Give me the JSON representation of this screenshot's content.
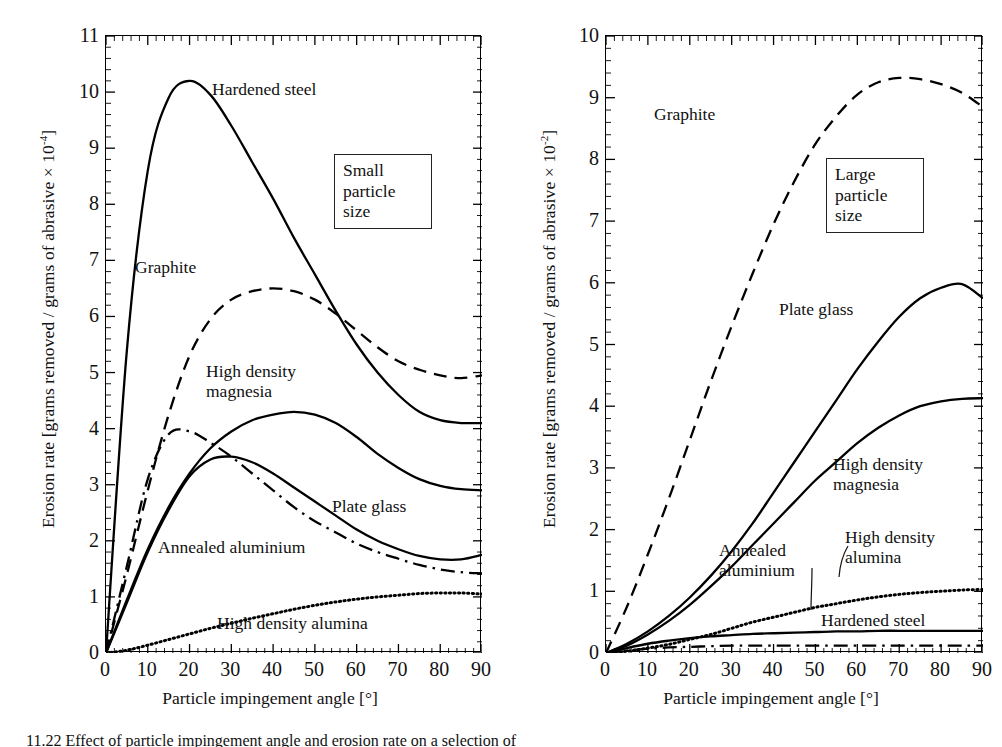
{
  "figure": {
    "caption": "11.22  Effect of particle impingement angle and erosion rate on a selection of"
  },
  "panels": [
    {
      "id": "small-particle",
      "note_box": "Small\nparticle\nsize",
      "xlabel": "Particle impingement angle [°]",
      "ylabel_pre": "Erosion rate [grams removed / grams of abrasive × 10",
      "ylabel_sup": "-4",
      "ylabel_post": "]",
      "yticks": [
        "0",
        "1",
        "2",
        "3",
        "4",
        "5",
        "6",
        "7",
        "8",
        "9",
        "10",
        "11"
      ],
      "xticks": [
        "0",
        "10",
        "20",
        "30",
        "40",
        "50",
        "60",
        "70",
        "80",
        "90"
      ],
      "curve_labels": [
        "Hardened steel",
        "Graphite",
        "High density\nmagnesia",
        "Plate glass",
        "Annealed aluminium",
        "High density alumina"
      ]
    },
    {
      "id": "large-particle",
      "note_box": "Large\nparticle\nsize",
      "xlabel": "Particle impingement angle [°]",
      "ylabel_pre": "Erosion rate [grams removed / grams of abrasive × 10",
      "ylabel_sup": "-2",
      "ylabel_post": "]",
      "yticks": [
        "0",
        "1",
        "2",
        "3",
        "4",
        "5",
        "6",
        "7",
        "8",
        "9",
        "10"
      ],
      "xticks": [
        "0",
        "10",
        "20",
        "30",
        "40",
        "50",
        "60",
        "70",
        "80",
        "90"
      ],
      "curve_labels": [
        "Graphite",
        "Plate glass",
        "High density\nmagnesia",
        "High density\nalumina",
        "Annealed\naluminium",
        "Hardened steel"
      ]
    }
  ],
  "chart_data": [
    {
      "type": "line",
      "title": "Small particle size",
      "xlabel": "Particle impingement angle [°]",
      "ylabel": "Erosion rate [grams removed / grams of abrasive × 10^-4]",
      "xlim": [
        0,
        90
      ],
      "ylim": [
        0,
        11
      ],
      "xticks": [
        0,
        10,
        20,
        30,
        40,
        50,
        60,
        70,
        80,
        90
      ],
      "yticks": [
        0,
        1,
        2,
        3,
        4,
        5,
        6,
        7,
        8,
        9,
        10,
        11
      ],
      "grid": false,
      "legend": "inline-labels",
      "x": [
        0,
        5,
        10,
        15,
        20,
        25,
        30,
        35,
        40,
        45,
        50,
        55,
        60,
        65,
        70,
        75,
        80,
        85,
        90
      ],
      "series": [
        {
          "name": "Hardened steel",
          "style": "solid",
          "values": [
            0,
            5.4,
            8.6,
            9.9,
            10.2,
            9.95,
            9.4,
            8.75,
            8.1,
            7.4,
            6.75,
            6.1,
            5.5,
            5.0,
            4.6,
            4.3,
            4.15,
            4.1,
            4.1
          ]
        },
        {
          "name": "Graphite",
          "style": "dashed",
          "values": [
            0,
            1.4,
            2.9,
            4.25,
            5.3,
            5.95,
            6.3,
            6.45,
            6.5,
            6.45,
            6.3,
            6.05,
            5.75,
            5.45,
            5.2,
            5.05,
            4.95,
            4.9,
            4.95
          ]
        },
        {
          "name": "High density magnesia",
          "style": "solid",
          "values": [
            0,
            0.95,
            1.85,
            2.6,
            3.2,
            3.65,
            3.95,
            4.15,
            4.25,
            4.3,
            4.25,
            4.1,
            3.85,
            3.55,
            3.3,
            3.1,
            2.98,
            2.92,
            2.9
          ]
        },
        {
          "name": "Plate glass",
          "style": "solid",
          "values": [
            0,
            0.9,
            1.8,
            2.55,
            3.15,
            3.45,
            3.5,
            3.4,
            3.2,
            2.95,
            2.7,
            2.45,
            2.2,
            2.0,
            1.85,
            1.73,
            1.67,
            1.67,
            1.75
          ]
        },
        {
          "name": "Annealed aluminium",
          "style": "dash-dot",
          "values": [
            0,
            1.55,
            3.1,
            3.9,
            3.95,
            3.75,
            3.5,
            3.2,
            2.9,
            2.6,
            2.35,
            2.15,
            1.95,
            1.8,
            1.68,
            1.57,
            1.49,
            1.44,
            1.42
          ]
        },
        {
          "name": "High density alumina",
          "style": "dotted",
          "values": [
            0,
            0.05,
            0.14,
            0.24,
            0.34,
            0.44,
            0.53,
            0.62,
            0.7,
            0.78,
            0.85,
            0.91,
            0.96,
            1.0,
            1.03,
            1.06,
            1.07,
            1.07,
            1.05
          ]
        }
      ]
    },
    {
      "type": "line",
      "title": "Large particle size",
      "xlabel": "Particle impingement angle [°]",
      "ylabel": "Erosion rate [grams removed / grams of abrasive × 10^-2]",
      "xlim": [
        0,
        90
      ],
      "ylim": [
        0,
        10
      ],
      "xticks": [
        0,
        10,
        20,
        30,
        40,
        50,
        60,
        70,
        80,
        90
      ],
      "yticks": [
        0,
        1,
        2,
        3,
        4,
        5,
        6,
        7,
        8,
        9,
        10
      ],
      "grid": false,
      "legend": "inline-labels",
      "x": [
        0,
        5,
        10,
        15,
        20,
        25,
        30,
        35,
        40,
        45,
        50,
        55,
        60,
        65,
        70,
        75,
        80,
        85,
        90
      ],
      "series": [
        {
          "name": "Graphite",
          "style": "dashed",
          "values": [
            0,
            0.75,
            1.6,
            2.5,
            3.45,
            4.4,
            5.3,
            6.15,
            6.95,
            7.65,
            8.25,
            8.7,
            9.05,
            9.25,
            9.32,
            9.3,
            9.22,
            9.08,
            8.85
          ]
        },
        {
          "name": "Plate glass",
          "style": "solid",
          "values": [
            0,
            0.15,
            0.35,
            0.6,
            0.9,
            1.25,
            1.65,
            2.1,
            2.6,
            3.1,
            3.6,
            4.1,
            4.6,
            5.05,
            5.45,
            5.75,
            5.92,
            5.98,
            5.75
          ]
        },
        {
          "name": "High density magnesia",
          "style": "solid",
          "values": [
            0,
            0.12,
            0.3,
            0.52,
            0.78,
            1.08,
            1.4,
            1.75,
            2.1,
            2.45,
            2.8,
            3.1,
            3.4,
            3.65,
            3.85,
            4.0,
            4.08,
            4.12,
            4.13
          ]
        },
        {
          "name": "High density alumina",
          "style": "dotted",
          "values": [
            0,
            0.03,
            0.08,
            0.14,
            0.22,
            0.3,
            0.4,
            0.5,
            0.58,
            0.66,
            0.74,
            0.8,
            0.86,
            0.91,
            0.95,
            0.98,
            1.0,
            1.02,
            1.03
          ]
        },
        {
          "name": "Hardened steel",
          "style": "solid",
          "values": [
            0,
            0.08,
            0.15,
            0.2,
            0.24,
            0.27,
            0.29,
            0.31,
            0.32,
            0.33,
            0.34,
            0.35,
            0.35,
            0.36,
            0.36,
            0.36,
            0.36,
            0.36,
            0.36
          ]
        },
        {
          "name": "Annealed aluminium",
          "style": "dash-dot",
          "values": [
            0,
            0.04,
            0.07,
            0.09,
            0.1,
            0.11,
            0.12,
            0.12,
            0.12,
            0.12,
            0.12,
            0.12,
            0.12,
            0.12,
            0.12,
            0.12,
            0.12,
            0.12,
            0.12
          ]
        }
      ]
    }
  ]
}
